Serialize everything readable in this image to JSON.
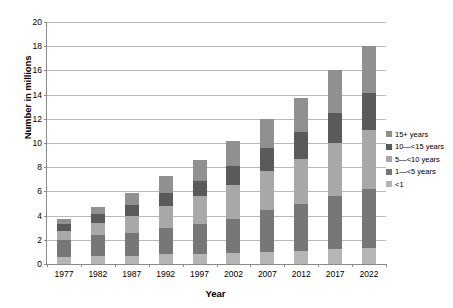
{
  "chart_data": {
    "type": "bar",
    "title": "",
    "subtitle": "",
    "xlabel": "Year",
    "ylabel": "Number in millions",
    "stacked": true,
    "grid": true,
    "legend_position": "right",
    "ylim": [
      0,
      20
    ],
    "ytick_step": 2,
    "ytick_labels": [
      "0",
      "2",
      "4",
      "6",
      "8",
      "10",
      "12",
      "14",
      "16",
      "18",
      "20"
    ],
    "categories": [
      "1977",
      "1982",
      "1987",
      "1992",
      "1997",
      "2002",
      "2007",
      "2012",
      "2017",
      "2022"
    ],
    "series": [
      {
        "name": "<1",
        "color": "#b5b5b5",
        "values": [
          0.6,
          0.7,
          0.7,
          0.8,
          0.8,
          0.9,
          1.0,
          1.1,
          1.2,
          1.3
        ]
      },
      {
        "name": "1—<5 years",
        "color": "#777777",
        "values": [
          1.4,
          1.7,
          1.9,
          2.2,
          2.5,
          2.8,
          3.5,
          3.9,
          4.4,
          4.9
        ]
      },
      {
        "name": "5—<10 years",
        "color": "#a8a8a8",
        "values": [
          0.7,
          1.0,
          1.4,
          1.8,
          2.3,
          2.8,
          3.2,
          3.7,
          4.4,
          4.9
        ]
      },
      {
        "name": "10—<15 years",
        "color": "#5a5a5a",
        "values": [
          0.6,
          0.7,
          0.9,
          1.1,
          1.3,
          1.6,
          1.9,
          2.2,
          2.5,
          3.0
        ]
      },
      {
        "name": "15+ years",
        "color": "#909090",
        "values": [
          0.4,
          0.6,
          1.0,
          1.4,
          1.7,
          2.1,
          2.4,
          2.8,
          3.5,
          3.9
        ]
      }
    ],
    "totals": [
      3.7,
      4.7,
      5.9,
      7.3,
      8.6,
      10.2,
      12.0,
      13.7,
      16.0,
      18.0
    ]
  },
  "legend": {
    "items": [
      {
        "label": "15+ years",
        "color": "#909090"
      },
      {
        "label": "10—<15 years",
        "color": "#5a5a5a"
      },
      {
        "label": "5—<10 years",
        "color": "#a8a8a8"
      },
      {
        "label": "1—<5 years",
        "color": "#777777"
      },
      {
        "label": "<1",
        "color": "#b5b5b5"
      }
    ]
  },
  "colors": {
    "axis": "#8a8a8a",
    "grid": "#b9b9b9",
    "background": "#ffffff",
    "text": "#000000"
  }
}
